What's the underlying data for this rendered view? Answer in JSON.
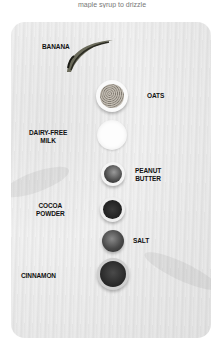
{
  "caption": "maple syrup to drizzle",
  "photo": {
    "background": "#ececec",
    "ingredients": [
      {
        "label": "BANANA",
        "icon": "banana-icon"
      },
      {
        "label": "OATS",
        "icon": "oats-bowl-icon"
      },
      {
        "label_line1": "DAIRY-FREE",
        "label_line2": "MILK",
        "icon": "milk-bowl-icon"
      },
      {
        "label_line1": "PEANUT",
        "label_line2": "BUTTER",
        "icon": "peanut-butter-bowl-icon"
      },
      {
        "label_line1": "COCOA",
        "label_line2": "POWDER",
        "icon": "cocoa-bowl-icon"
      },
      {
        "label": "SALT",
        "icon": "salt-bowl-icon"
      },
      {
        "label": "CINNAMON",
        "icon": "cinnamon-bowl-icon"
      }
    ]
  }
}
